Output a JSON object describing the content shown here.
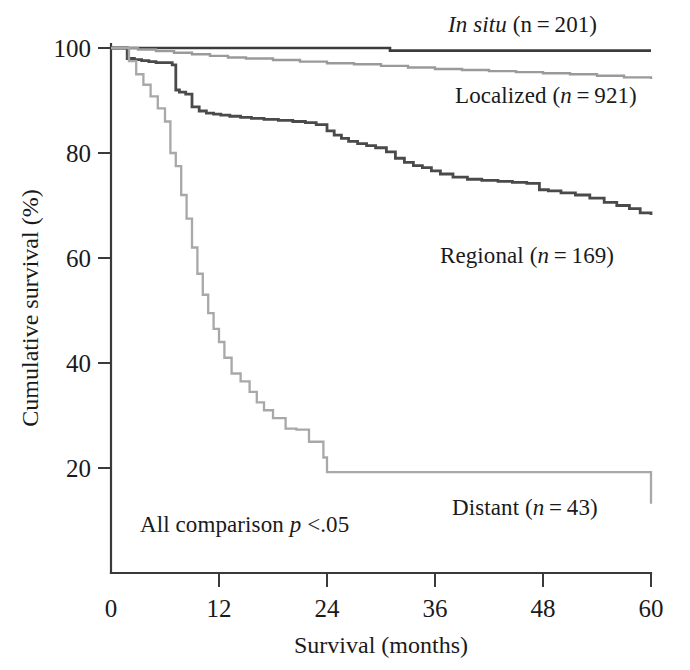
{
  "chart_data": {
    "type": "line",
    "title": "",
    "subtitle": "",
    "xlabel": "Survival (months)",
    "ylabel": "Cumulative survival (%)",
    "xlim": [
      0,
      60
    ],
    "ylim": [
      0,
      105
    ],
    "xticks": [
      0,
      12,
      24,
      36,
      48,
      60
    ],
    "xtick_labels": [
      "0",
      "12",
      "24",
      "36",
      "48",
      "60"
    ],
    "yticks": [
      20,
      40,
      60,
      80,
      100
    ],
    "ytick_labels": [
      "20",
      "40",
      "60",
      "80",
      "100"
    ],
    "grid": false,
    "legend_position": "inline-annotations",
    "step_type": "post",
    "annotations": [
      {
        "name": "p-value-note",
        "text_plain": "All comparison p <.05",
        "text_prefix": "All comparison ",
        "text_italic": "p",
        "text_suffix": " <.05",
        "x": 3.2,
        "y": 10
      }
    ],
    "series": [
      {
        "name": "In situ",
        "label_prefix_italic": "In situ",
        "label_suffix": " (n = 201)",
        "n": 201,
        "color": "#3c3c3c",
        "linewidth": 2.6,
        "x": [
          0,
          1,
          30,
          31,
          60
        ],
        "values": [
          100,
          100,
          100,
          99.5,
          99.5
        ]
      },
      {
        "name": "Localized",
        "label_prefix_italic": "",
        "label_suffix": "Localized (n = 921)",
        "n": 921,
        "color": "#9a9a9a",
        "linewidth": 2.4,
        "x": [
          0,
          1,
          3,
          5,
          7,
          9,
          11,
          13,
          15,
          18,
          21,
          24,
          27,
          30,
          33,
          36,
          39,
          42,
          45,
          48,
          51,
          54,
          57,
          60
        ],
        "values": [
          100,
          100,
          99.7,
          99.4,
          99.1,
          98.8,
          98.5,
          98.2,
          98.0,
          97.7,
          97.4,
          97.1,
          96.9,
          96.6,
          96.3,
          96.0,
          95.8,
          95.6,
          95.4,
          95.2,
          95.0,
          94.7,
          94.4,
          94.1
        ]
      },
      {
        "name": "Regional",
        "label_prefix_italic": "",
        "label_suffix": "Regional (n = 169)",
        "n": 169,
        "color": "#4a4a4a",
        "linewidth": 2.8,
        "x": [
          0,
          1,
          1.8,
          2.6,
          3.4,
          4.2,
          5.0,
          6.8,
          7.2,
          7.6,
          8.3,
          9.0,
          9.8,
          10.6,
          11.4,
          12.2,
          13.2,
          14.4,
          15.6,
          17.0,
          18.6,
          20.2,
          21.6,
          22.8,
          24.0,
          24.8,
          25.6,
          26.4,
          27.4,
          28.4,
          29.4,
          30.6,
          31.6,
          32.6,
          33.6,
          34.6,
          35.6,
          36.6,
          38.0,
          39.6,
          41.2,
          43.0,
          44.6,
          46.2,
          47.6,
          48.6,
          50.0,
          51.6,
          53.2,
          54.8,
          56.2,
          57.6,
          58.8,
          60
        ],
        "values": [
          100,
          100,
          98.0,
          97.8,
          97.6,
          97.4,
          97.2,
          96.8,
          92.0,
          91.6,
          91.2,
          88.8,
          88.0,
          87.6,
          87.4,
          87.2,
          87.0,
          86.8,
          86.6,
          86.4,
          86.2,
          86.0,
          85.8,
          85.4,
          84.2,
          83.4,
          82.8,
          82.2,
          81.8,
          81.4,
          81.0,
          80.2,
          79.0,
          78.2,
          77.6,
          77.2,
          76.6,
          76.0,
          75.4,
          75.0,
          74.8,
          74.6,
          74.4,
          74.2,
          73.0,
          72.8,
          72.4,
          72.0,
          71.4,
          70.6,
          70.0,
          69.4,
          68.6,
          68.2
        ]
      },
      {
        "name": "Distant",
        "label_prefix_italic": "",
        "label_suffix": "Distant (n = 43)",
        "n": 43,
        "color": "#a8a8a8",
        "linewidth": 2.3,
        "x": [
          0,
          0.8,
          2.0,
          2.8,
          3.6,
          4.4,
          5.2,
          6.0,
          6.6,
          7.2,
          7.8,
          8.4,
          9.0,
          9.6,
          10.2,
          10.8,
          11.4,
          12.0,
          12.6,
          13.4,
          14.4,
          15.4,
          16.2,
          17.0,
          18.0,
          19.4,
          20.6,
          22.0,
          23.6,
          24.0,
          30.0,
          54.0,
          60.0
        ],
        "values": [
          100,
          100,
          97.5,
          95.0,
          93.0,
          90.8,
          88.5,
          86.0,
          80.0,
          77.5,
          72.0,
          67.5,
          62.0,
          57.0,
          53.0,
          49.5,
          46.5,
          44.0,
          41.0,
          38.0,
          36.5,
          34.5,
          32.5,
          31.0,
          29.5,
          27.5,
          27.3,
          25.0,
          22.0,
          19.2,
          19.2,
          19.2,
          13.2
        ]
      }
    ]
  },
  "labels": {
    "insitu_italic": "In situ",
    "insitu_rest": " (n = 201)",
    "localized_pre": "Localized (",
    "localized_n_italic": "n",
    "localized_post": " = 921)",
    "regional_pre": "Regional (",
    "regional_n_italic": "n",
    "regional_post": " = 169)",
    "distant_pre": "Distant (",
    "distant_n_italic": "n",
    "distant_post": " = 43)",
    "pvalue_pre": "All comparison ",
    "pvalue_italic": "p",
    "pvalue_post": " <.05"
  },
  "axes": {
    "x_title": "Survival (months)",
    "y_title": "Cumulative survival (%)"
  },
  "colors": {
    "insitu": "#3c3c3c",
    "localized": "#9a9a9a",
    "regional": "#4a4a4a",
    "distant": "#a8a8a8",
    "axis": "#3a3a3a",
    "text": "#1a1a1a"
  }
}
